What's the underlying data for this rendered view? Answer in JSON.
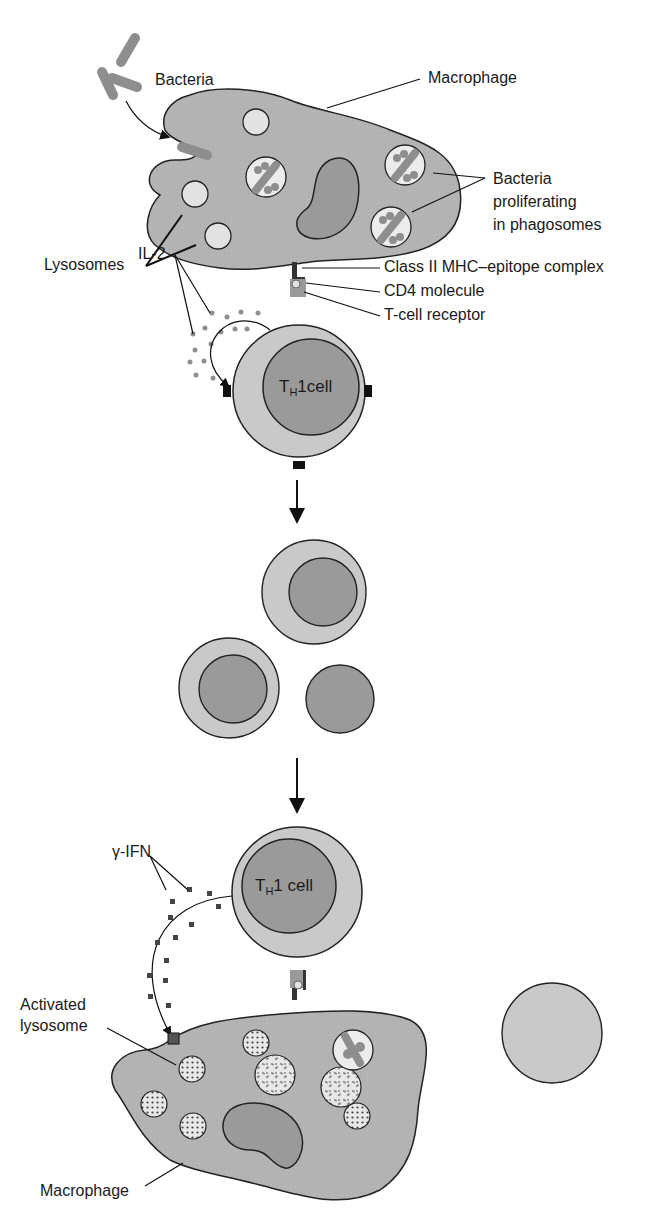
{
  "figure": {
    "colors": {
      "cell_fill": "#b4b4b4",
      "nucleus_fill": "#9a9a9a",
      "lysosome_fill": "#e2e2e2",
      "tcell_outer": "#c9c9c9",
      "bacteria": "#8e8e8e",
      "outline": "#222222",
      "marker": "#111111"
    }
  },
  "labels": {
    "bacteria": "Bacteria",
    "macrophage_top": "Macrophage",
    "bacteria_proliferating": [
      "Bacteria",
      "proliferating",
      "in phagosomes"
    ],
    "lysosomes": "Lysosomes",
    "class_ii_mhc": "Class II MHC–epitope complex",
    "cd4": "CD4 molecule",
    "tcr": "T-cell receptor",
    "il2": "IL-2",
    "th1_top": {
      "prefix": "T",
      "sub": "H",
      "suffix": "1cell"
    },
    "gamma_ifn": "γ-IFN",
    "th1_bottom": {
      "prefix": "T",
      "sub": "H",
      "suffix": "1 cell"
    },
    "activated_lysosome": [
      "Activated",
      "lysosome"
    ],
    "macrophage_bottom": "Macrophage"
  },
  "stages": [
    {
      "step": 1,
      "description": "Infected macrophage presents epitope to TH1 cell; IL-2 autocrine stimulation"
    },
    {
      "step": 2,
      "description": "TH1 cell proliferation (clonal expansion)"
    },
    {
      "step": 3,
      "description": "TH1 cell secretes gamma-IFN, activating macrophage lysosomes"
    }
  ]
}
